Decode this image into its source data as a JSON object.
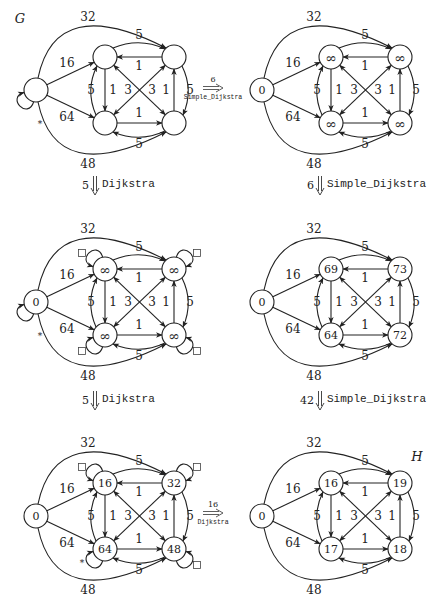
{
  "figure": {
    "labels": {
      "G": "G",
      "H": "H"
    },
    "graphs": [
      {
        "id": "g1",
        "origin": [
          0,
          0
        ],
        "source_label": "",
        "node_labels": {
          "tl": "",
          "tr": "",
          "bl": "",
          "br": ""
        },
        "self_loops": {
          "source": true,
          "tl": false,
          "tr": false,
          "bl": false,
          "br": false
        },
        "markers": {
          "source": "*"
        },
        "squares": {
          "tl": false,
          "tr": false,
          "bl": false,
          "br": false
        },
        "title": "G"
      },
      {
        "id": "g2",
        "origin": [
          226,
          0
        ],
        "source_label": "0",
        "node_labels": {
          "tl": "∞",
          "tr": "∞",
          "bl": "∞",
          "br": "∞"
        },
        "self_loops": {
          "source": false,
          "tl": false,
          "tr": false,
          "bl": false,
          "br": false
        },
        "markers": {},
        "squares": {
          "tl": false,
          "tr": false,
          "bl": false,
          "br": false
        },
        "title": ""
      },
      {
        "id": "g3",
        "origin": [
          0,
          212
        ],
        "source_label": "0",
        "node_labels": {
          "tl": "∞",
          "tr": "∞",
          "bl": "∞",
          "br": "∞"
        },
        "self_loops": {
          "source": true,
          "tl": true,
          "tr": true,
          "bl": true,
          "br": true
        },
        "markers": {
          "source": "*"
        },
        "squares": {
          "tl": true,
          "tr": true,
          "bl": true,
          "br": true
        },
        "title": ""
      },
      {
        "id": "g4",
        "origin": [
          226,
          212
        ],
        "source_label": "0",
        "node_labels": {
          "tl": "69",
          "tr": "73",
          "bl": "64",
          "br": "72"
        },
        "self_loops": {
          "source": false,
          "tl": false,
          "tr": false,
          "bl": false,
          "br": false
        },
        "markers": {},
        "squares": {
          "tl": false,
          "tr": false,
          "bl": false,
          "br": false
        },
        "title": ""
      },
      {
        "id": "g5",
        "origin": [
          0,
          426
        ],
        "source_label": "0",
        "node_labels": {
          "tl": "16",
          "tr": "32",
          "bl": "64",
          "br": "48"
        },
        "self_loops": {
          "source": false,
          "tl": true,
          "tr": true,
          "bl": true,
          "br": true
        },
        "markers": {
          "bl": "*"
        },
        "squares": {
          "tl": true,
          "tr": true,
          "bl": false,
          "br": true
        },
        "title": ""
      },
      {
        "id": "g6",
        "origin": [
          226,
          426
        ],
        "source_label": "0",
        "node_labels": {
          "tl": "16",
          "tr": "19",
          "bl": "17",
          "br": "18"
        },
        "self_loops": {
          "source": false,
          "tl": false,
          "tr": false,
          "bl": false,
          "br": false
        },
        "markers": {},
        "squares": {
          "tl": false,
          "tr": false,
          "bl": false,
          "br": false
        },
        "title": "H"
      }
    ],
    "edge_weights": {
      "s_tr_arc_top": "32",
      "s_tl": "16",
      "s_bl": "64",
      "s_br_arc_bottom": "48",
      "tl_tr": "5",
      "tr_tl": "1",
      "tl_bl": "1",
      "bl_tl": "5",
      "tl_br": "3",
      "bl_tr": "3",
      "bl_br": "1",
      "br_bl": "5",
      "br_tr": "1",
      "tr_br": "5"
    },
    "transitions": [
      {
        "id": "t1",
        "direction": "right",
        "cost": "6",
        "algorithm": "Simple_Dijkstra",
        "from": "g1",
        "to": "g2"
      },
      {
        "id": "t2",
        "direction": "down",
        "cost": "5",
        "algorithm": "Dijkstra",
        "from": "g1",
        "to": "g3"
      },
      {
        "id": "t3",
        "direction": "down",
        "cost": "6",
        "algorithm": "Simple_Dijkstra",
        "from": "g2",
        "to": "g4"
      },
      {
        "id": "t4",
        "direction": "down",
        "cost": "5",
        "algorithm": "Dijkstra",
        "from": "g3",
        "to": "g5"
      },
      {
        "id": "t5",
        "direction": "down",
        "cost": "42",
        "algorithm": "Simple_Dijkstra",
        "from": "g4",
        "to": "g6"
      },
      {
        "id": "t6",
        "direction": "right",
        "cost": "16",
        "algorithm": "Dijkstra",
        "from": "g5",
        "to": "g6"
      }
    ]
  }
}
